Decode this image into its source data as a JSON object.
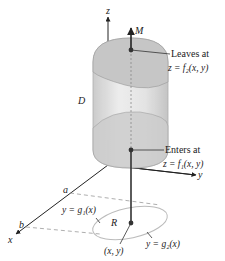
{
  "figure": {
    "type": "3d-region-diagram",
    "axes": {
      "x_label": "x",
      "y_label": "y",
      "z_label": "z"
    },
    "region_labels": {
      "solid": "D",
      "base_region": "R",
      "line_label": "M"
    },
    "point_label": "(x, y)",
    "x_bounds": {
      "lower": "a",
      "upper": "b"
    },
    "boundary_curves": {
      "lower": "y = g₁(x)",
      "upper": "y = g₂(x)"
    },
    "annotations": {
      "leaves_title": "Leaves at",
      "leaves_eq": "z = f₂(x, y)",
      "enters_title": "Enters at",
      "enters_eq": "z = f₁(x, y)"
    },
    "colors": {
      "solid_fill": "#d8d8d8",
      "solid_top": "#c4c4c4",
      "ink": "#222222",
      "dashed": "#999999"
    }
  }
}
